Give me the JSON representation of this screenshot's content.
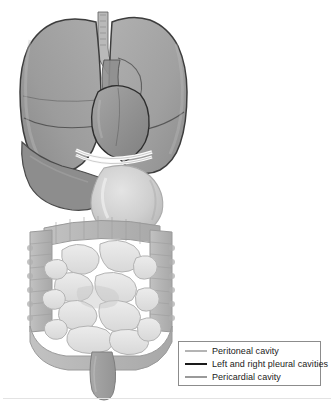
{
  "figure": {
    "background_color": "#ffffff"
  },
  "legend": {
    "border_color": "#8c8c8c",
    "background_color": "#ffffff",
    "items": [
      {
        "label": "Peritoneal cavity",
        "swatch_color": "#b4b4b4",
        "swatch_thickness": 2,
        "swatch_name": "line-swatch-peritoneal"
      },
      {
        "label": "Left and right pleural cavities",
        "swatch_color": "#1a1a1a",
        "swatch_thickness": 2,
        "swatch_name": "line-swatch-pleural"
      },
      {
        "label": "Pericardial cavity",
        "swatch_color": "#9a9a9a",
        "swatch_thickness": 2,
        "swatch_name": "line-swatch-pericardial"
      }
    ]
  },
  "anatomy": {
    "colors": {
      "lung_fill": "#a3a3a3",
      "lung_fill_dark": "#8f8f8f",
      "lung_outline": "#3d3d3d",
      "heart_fill": "#9b9b9b",
      "heart_outline": "#2e2e2e",
      "diaphragm_band": "#fbfbfb",
      "stomach_fill": "#c9c9c9",
      "stomach_highlight": "#dcdcdc",
      "large_intestine_fill": "#b8b8b8",
      "small_intestine_fill": "#e2e2e2",
      "small_intestine_outline": "#b0b0b0",
      "rectum_fill": "#9e9e9e",
      "liver_fill": "#8a8a8a",
      "trachea_fill": "#b9b9b9"
    },
    "structures": [
      {
        "name": "trachea",
        "label": "Trachea"
      },
      {
        "name": "right-lung",
        "label": "Right lung"
      },
      {
        "name": "left-lung",
        "label": "Left lung"
      },
      {
        "name": "heart",
        "label": "Heart"
      },
      {
        "name": "diaphragm",
        "label": "Diaphragm"
      },
      {
        "name": "liver",
        "label": "Liver"
      },
      {
        "name": "stomach",
        "label": "Stomach"
      },
      {
        "name": "large-intestine",
        "label": "Large intestine"
      },
      {
        "name": "small-intestine",
        "label": "Small intestine"
      },
      {
        "name": "rectum",
        "label": "Rectum"
      }
    ]
  }
}
